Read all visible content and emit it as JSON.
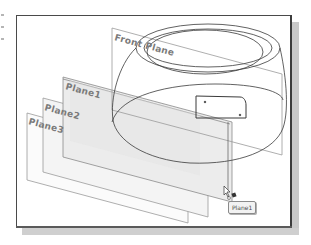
{
  "viewport": {
    "title": "3D model viewport",
    "planes": [
      {
        "id": "front-plane",
        "label": "Front Plane"
      },
      {
        "id": "plane1",
        "label": "Plane1"
      },
      {
        "id": "plane2",
        "label": "Plane2"
      },
      {
        "id": "plane3",
        "label": "Plane3"
      }
    ],
    "cursor": {
      "icon": "pointer-with-plane-icon",
      "tooltip": "Plane1"
    }
  },
  "colors": {
    "frame_border": "#4a4a4a",
    "shadow": "#c9c9c9",
    "plane_edge": "#8c8c8c",
    "plane_fill_selected": "#e9e9e9",
    "label": "#7a7a7a",
    "model_edge": "#3a3a3a"
  }
}
